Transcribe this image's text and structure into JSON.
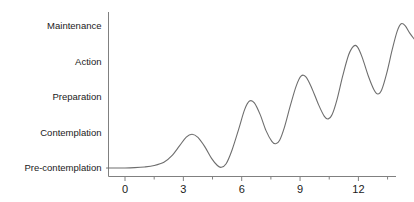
{
  "chart_data": {
    "type": "line",
    "title": "",
    "subtitle": "",
    "xlabel": "",
    "ylabel": "",
    "grid": false,
    "legend": "none",
    "line_color": "#6e6e6e",
    "axis_color": "#808080",
    "text_color": "#1a1a1a",
    "background": "#ffffff",
    "xlim": [
      -1,
      13.5
    ],
    "ylim": [
      0,
      5.4
    ],
    "x_ticks_major": [
      0,
      3,
      6,
      9,
      12
    ],
    "x_tick_labels": [
      "0",
      "3",
      "6",
      "9",
      "12"
    ],
    "x_ticks_minor": [
      1.5,
      4.5,
      7.5,
      10.5,
      13.5
    ],
    "y_categories": [
      "Pre-contemplation",
      "Contemplation",
      "Preparation",
      "Action",
      "Maintenance"
    ],
    "y_category_values": [
      1,
      2,
      3,
      4,
      5
    ],
    "points": [
      {
        "x": -0.95,
        "y": 1.0
      },
      {
        "x": -0.4,
        "y": 1.0
      },
      {
        "x": 0.0,
        "y": 1.0
      },
      {
        "x": 0.5,
        "y": 1.01
      },
      {
        "x": 1.0,
        "y": 1.03
      },
      {
        "x": 1.5,
        "y": 1.07
      },
      {
        "x": 2.0,
        "y": 1.16
      },
      {
        "x": 2.4,
        "y": 1.34
      },
      {
        "x": 2.8,
        "y": 1.62
      },
      {
        "x": 3.15,
        "y": 1.87
      },
      {
        "x": 3.45,
        "y": 1.95
      },
      {
        "x": 3.75,
        "y": 1.86
      },
      {
        "x": 4.1,
        "y": 1.6
      },
      {
        "x": 4.45,
        "y": 1.27
      },
      {
        "x": 4.75,
        "y": 1.07
      },
      {
        "x": 4.95,
        "y": 1.02
      },
      {
        "x": 5.2,
        "y": 1.12
      },
      {
        "x": 5.5,
        "y": 1.5
      },
      {
        "x": 5.85,
        "y": 2.1
      },
      {
        "x": 6.15,
        "y": 2.64
      },
      {
        "x": 6.4,
        "y": 2.88
      },
      {
        "x": 6.65,
        "y": 2.83
      },
      {
        "x": 6.95,
        "y": 2.5
      },
      {
        "x": 7.25,
        "y": 2.05
      },
      {
        "x": 7.55,
        "y": 1.75
      },
      {
        "x": 7.75,
        "y": 1.68
      },
      {
        "x": 7.95,
        "y": 1.78
      },
      {
        "x": 8.2,
        "y": 2.15
      },
      {
        "x": 8.5,
        "y": 2.75
      },
      {
        "x": 8.8,
        "y": 3.3
      },
      {
        "x": 9.05,
        "y": 3.58
      },
      {
        "x": 9.3,
        "y": 3.56
      },
      {
        "x": 9.6,
        "y": 3.25
      },
      {
        "x": 9.95,
        "y": 2.78
      },
      {
        "x": 10.25,
        "y": 2.45
      },
      {
        "x": 10.45,
        "y": 2.38
      },
      {
        "x": 10.65,
        "y": 2.5
      },
      {
        "x": 10.9,
        "y": 2.92
      },
      {
        "x": 11.2,
        "y": 3.6
      },
      {
        "x": 11.5,
        "y": 4.18
      },
      {
        "x": 11.75,
        "y": 4.42
      },
      {
        "x": 11.95,
        "y": 4.4
      },
      {
        "x": 12.2,
        "y": 4.1
      },
      {
        "x": 12.5,
        "y": 3.6
      },
      {
        "x": 12.8,
        "y": 3.2
      },
      {
        "x": 13.0,
        "y": 3.08
      },
      {
        "x": 13.2,
        "y": 3.2
      },
      {
        "x": 13.45,
        "y": 3.65
      },
      {
        "x": 13.75,
        "y": 4.35
      },
      {
        "x": 14.0,
        "y": 4.85
      },
      {
        "x": 14.2,
        "y": 5.05
      },
      {
        "x": 14.4,
        "y": 5.0
      },
      {
        "x": 14.65,
        "y": 4.78
      },
      {
        "x": 14.9,
        "y": 4.6
      }
    ]
  },
  "axis": {
    "y_axis_name": "stage-axis",
    "x_axis_name": "time-axis"
  }
}
